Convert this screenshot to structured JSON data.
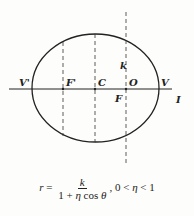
{
  "labels": {
    "v_prime": "V'",
    "f_prime": "F'",
    "c": "C",
    "o": "O",
    "v": "V",
    "f": "F",
    "i": "I",
    "k": "k"
  },
  "formula": {
    "lhs": "r",
    "equals": "=",
    "numerator": "k",
    "denominator_one": "1 + ",
    "denominator_eta": "η",
    "denominator_cos": " cos ",
    "denominator_theta": "θ",
    "separator": ", ",
    "condition_left": "0 < ",
    "condition_eta": "η",
    "condition_right": " < 1"
  },
  "colors": {
    "ink": "#222222",
    "background": "#fdfdfb"
  }
}
